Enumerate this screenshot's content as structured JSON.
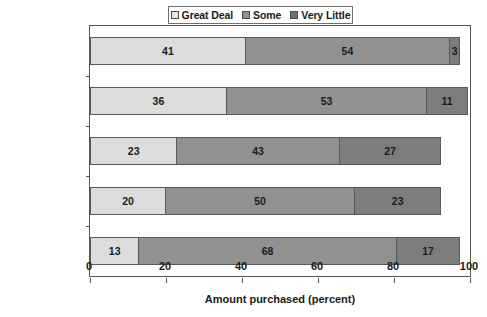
{
  "chart_data": {
    "type": "bar",
    "orientation": "horizontal",
    "stacked": true,
    "title": "",
    "xlabel": "Amount purchased (percent)",
    "ylabel": "",
    "xlim": [
      0,
      100
    ],
    "xticks": [
      0,
      20,
      40,
      60,
      80,
      100
    ],
    "grid": false,
    "legend_position": "top-center",
    "categories": [
      "CA PCA",
      "FL Distributor",
      "CA Grower",
      "FL Grower",
      "Golf Supt."
    ],
    "series": [
      {
        "name": "Great Deal",
        "color": "#dcdcdc",
        "values": [
          41,
          36,
          23,
          20,
          13
        ]
      },
      {
        "name": "Some",
        "color": "#919191",
        "values": [
          54,
          53,
          43,
          50,
          68
        ]
      },
      {
        "name": "Very Little",
        "color": "#7d7d7d",
        "values": [
          3,
          11,
          27,
          23,
          17
        ]
      }
    ],
    "rows": [
      {
        "category": "CA PCA",
        "segments": [
          {
            "series": "Great Deal",
            "value": 41,
            "label": "41"
          },
          {
            "series": "Some",
            "value": 54,
            "label": "54"
          },
          {
            "series": "Very Little",
            "value": 3,
            "label": "3"
          }
        ]
      },
      {
        "category": "FL Distributor",
        "segments": [
          {
            "series": "Great Deal",
            "value": 36,
            "label": "36"
          },
          {
            "series": "Some",
            "value": 53,
            "label": "53"
          },
          {
            "series": "Very Little",
            "value": 11,
            "label": "11"
          }
        ]
      },
      {
        "category": "CA Grower",
        "segments": [
          {
            "series": "Great Deal",
            "value": 23,
            "label": "23"
          },
          {
            "series": "Some",
            "value": 43,
            "label": "43"
          },
          {
            "series": "Very Little",
            "value": 27,
            "label": "27"
          }
        ]
      },
      {
        "category": "FL Grower",
        "segments": [
          {
            "series": "Great Deal",
            "value": 20,
            "label": "20"
          },
          {
            "series": "Some",
            "value": 50,
            "label": "50"
          },
          {
            "series": "Very Little",
            "value": 23,
            "label": "23"
          }
        ]
      },
      {
        "category": "Golf Supt.",
        "segments": [
          {
            "series": "Great Deal",
            "value": 13,
            "label": "13"
          },
          {
            "series": "Some",
            "value": 68,
            "label": "68"
          },
          {
            "series": "Very Little",
            "value": 17,
            "label": "17"
          }
        ]
      }
    ]
  },
  "legend": {
    "items": [
      {
        "label": "Great Deal",
        "color": "#e8e8e8"
      },
      {
        "label": "Some",
        "color": "#919191"
      },
      {
        "label": "Very Little",
        "color": "#6f6f6f"
      }
    ]
  },
  "axis": {
    "x_title": "Amount purchased (percent)",
    "x_tick_labels": [
      "0",
      "20",
      "40",
      "60",
      "80",
      "100"
    ],
    "y_tick_labels": [
      "CA PCA",
      "FL Distributor",
      "CA Grower",
      "FL Grower",
      "Golf Supt."
    ]
  }
}
